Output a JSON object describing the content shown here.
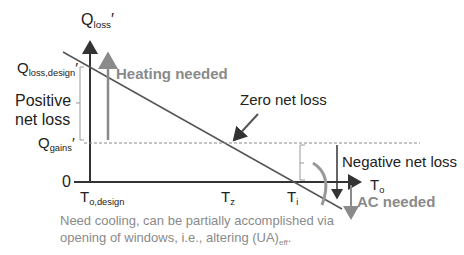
{
  "y_axis": {
    "main": "Q",
    "sub": "loss",
    "prime": "′"
  },
  "x_axis": {
    "main": "T",
    "sub": "o"
  },
  "labels": {
    "q_loss_design": {
      "main": "Q",
      "sub": "loss,design",
      "prime": "′"
    },
    "q_gains": {
      "main": "Q",
      "sub": "gains",
      "prime": "′"
    },
    "zero": "0",
    "positive_net_loss_1": "Positive",
    "positive_net_loss_2": "net loss",
    "heating_needed": "Heating needed",
    "zero_net_loss": "Zero net loss",
    "negative_net_loss": "Negative net loss",
    "ac_needed": "AC needed",
    "t_o_design": {
      "main": "T",
      "sub": "o,design"
    },
    "t_z": {
      "main": "T",
      "sub": "z"
    },
    "t_i": {
      "main": "T",
      "sub": "i"
    },
    "cooling_note_1": "Need cooling, can be partially accomplished via",
    "cooling_note_2_pre": "opening of windows, i.e., altering (UA)",
    "cooling_note_2_sub": "eff",
    "cooling_note_2_post": "."
  },
  "colors": {
    "axis": "#333333",
    "line": "#555555",
    "grey": "#8a8a8a"
  }
}
